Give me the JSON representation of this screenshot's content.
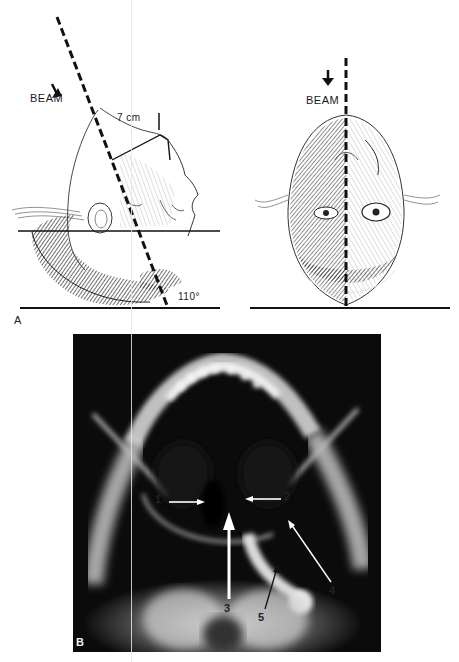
{
  "figure": {
    "panel_a": {
      "letter": "A",
      "lateral_view": {
        "beam_label": "BEAM",
        "distance_label": "7 cm",
        "angle_label": "110°",
        "icons": [
          "arrow-down-icon"
        ]
      },
      "frontal_view": {
        "beam_label": "BEAM",
        "icons": [
          "arrow-down-icon"
        ]
      }
    },
    "panel_b": {
      "letter": "B",
      "annotations": [
        {
          "id": "1",
          "label": "1"
        },
        {
          "id": "2",
          "label": "2"
        },
        {
          "id": "3",
          "label": "3"
        },
        {
          "id": "4",
          "label": "4"
        },
        {
          "id": "5",
          "label": "5"
        }
      ]
    }
  },
  "colors": {
    "ink": "#111111",
    "xray_background": "#0b0b0b",
    "xray_bone": "#e8e8e8",
    "paper": "#ffffff"
  }
}
